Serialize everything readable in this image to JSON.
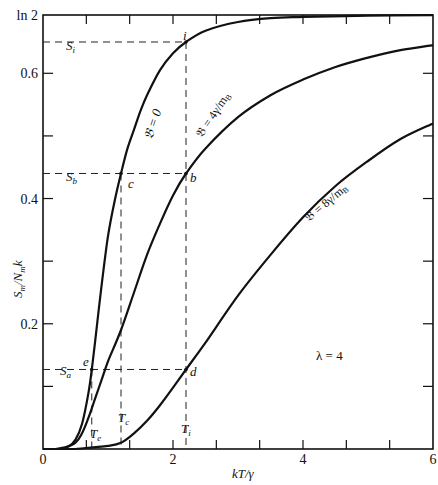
{
  "chart_data": {
    "type": "line",
    "title": "",
    "xlabel": "kT/γ",
    "ylabel": "S_m/N_m k",
    "xlim": [
      0,
      6
    ],
    "ylim": [
      0,
      0.6931
    ],
    "x_ticks": [
      0,
      0.6667,
      1.3333,
      2,
      2.6667,
      3.3333,
      4,
      4.6667,
      5.3333,
      6
    ],
    "x_tick_labels": [
      {
        "v": 0,
        "t": "0"
      },
      {
        "v": 2,
        "t": "2"
      },
      {
        "v": 4,
        "t": "4"
      },
      {
        "v": 6,
        "t": "6"
      }
    ],
    "y_ticks": [
      0.1,
      0.2,
      0.3,
      0.4,
      0.5,
      0.6
    ],
    "y_tick_labels": [
      {
        "v": 0.2,
        "t": "0.2"
      },
      {
        "v": 0.4,
        "t": "0.4"
      },
      {
        "v": 0.6,
        "t": "0.6"
      },
      {
        "v": 0.6931,
        "t": "ln 2"
      }
    ],
    "grid": false,
    "annotation_text": "λ = 4",
    "series": [
      {
        "name": "𝔅 = 0",
        "label": "𝔅 = 0",
        "x": [
          0.2,
          0.4,
          0.5,
          0.6,
          0.7,
          0.75,
          0.8,
          0.9,
          1.0,
          1.1,
          1.2,
          1.3,
          1.4,
          1.5,
          1.6,
          1.8,
          2.0,
          2.2,
          2.5,
          3.0,
          3.5,
          4.0,
          5.0,
          6.0
        ],
        "y": [
          0.0,
          0.005,
          0.015,
          0.04,
          0.09,
          0.127,
          0.17,
          0.26,
          0.34,
          0.395,
          0.44,
          0.48,
          0.51,
          0.54,
          0.565,
          0.605,
          0.632,
          0.65,
          0.668,
          0.682,
          0.688,
          0.69,
          0.692,
          0.693
        ]
      },
      {
        "name": "𝔅 = 4γ/m_B",
        "label": "𝔅 = 4γ/m_B",
        "x": [
          0.3,
          0.5,
          0.6,
          0.7,
          0.8,
          0.9,
          1.0,
          1.2,
          1.4,
          1.6,
          1.8,
          2.0,
          2.2,
          2.5,
          3.0,
          3.5,
          4.0,
          4.5,
          5.0,
          5.5,
          6.0
        ],
        "y": [
          0.0,
          0.01,
          0.025,
          0.05,
          0.08,
          0.11,
          0.14,
          0.19,
          0.25,
          0.31,
          0.36,
          0.405,
          0.44,
          0.48,
          0.53,
          0.565,
          0.59,
          0.61,
          0.625,
          0.637,
          0.645
        ]
      },
      {
        "name": "𝔅 = 8γ/m_B",
        "label": "𝔅 = 8γ/m_B",
        "x": [
          0.5,
          1.0,
          1.2,
          1.4,
          1.6,
          1.8,
          2.0,
          2.2,
          2.5,
          3.0,
          3.5,
          4.0,
          4.5,
          5.0,
          5.5,
          6.0
        ],
        "y": [
          0.0,
          0.005,
          0.01,
          0.025,
          0.045,
          0.07,
          0.098,
          0.127,
          0.17,
          0.245,
          0.31,
          0.37,
          0.42,
          0.46,
          0.495,
          0.52
        ]
      }
    ],
    "reference_lines": {
      "horizontal": [
        {
          "name": "S_i",
          "y": 0.65,
          "x_end": 2.2
        },
        {
          "name": "S_b",
          "y": 0.44,
          "x_end": 2.2
        },
        {
          "name": "S_a",
          "y": 0.127,
          "x_end": 2.2
        }
      ],
      "vertical": [
        {
          "name": "T_e",
          "x": 0.75,
          "y_end": 0.127
        },
        {
          "name": "T_c",
          "x": 1.2,
          "y_end": 0.44
        },
        {
          "name": "T_i",
          "x": 2.2,
          "y_end": 0.65
        }
      ]
    },
    "points": [
      {
        "name": "i",
        "x": 2.2,
        "y": 0.65
      },
      {
        "name": "c",
        "x": 1.2,
        "y": 0.44
      },
      {
        "name": "b",
        "x": 2.2,
        "y": 0.44
      },
      {
        "name": "e",
        "x": 0.75,
        "y": 0.127
      },
      {
        "name": "d",
        "x": 2.2,
        "y": 0.127
      }
    ]
  },
  "labels": {
    "S_i": "S",
    "S_i_sub": "i",
    "S_b": "S",
    "S_b_sub": "b",
    "S_a": "S",
    "S_a_sub": "a",
    "T_e": "T",
    "T_e_sub": "e",
    "T_c": "T",
    "T_c_sub": "c",
    "T_i": "T",
    "T_i_sub": "i",
    "pt_i": "i",
    "pt_c": "c",
    "pt_b": "b",
    "pt_e": "e",
    "pt_d": "d",
    "curve0": "𝔅 = 0",
    "curve4": "𝔅 = 4γ/m",
    "curve4_sub": "B",
    "curve8": "𝔅 = 8γ/m",
    "curve8_sub": "B",
    "lambda": "λ = 4",
    "xlabel": "kT/γ",
    "ylabel_S": "S",
    "ylabel_m": "m",
    "ylabel_N": "/N",
    "ylabel_m2": "m",
    "ylabel_k": "k"
  }
}
